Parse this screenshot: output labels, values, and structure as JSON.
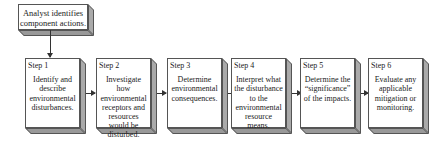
{
  "start": {
    "text": "Analyst identifies component actions."
  },
  "steps": [
    {
      "label": "Step 1",
      "text": "Identify and describe environmental disturbances."
    },
    {
      "label": "Step 2",
      "text": "Investigate how environmental receptors and resources would be disturbed."
    },
    {
      "label": "Step 3",
      "text": "Determine environmental consequences."
    },
    {
      "label": "Step 4",
      "text": "Interpret what the disturbance to the environmental resource means."
    },
    {
      "label": "Step 5",
      "text": "Determine the “significance” of the impacts."
    },
    {
      "label": "Step 6",
      "text": "Evaluate any applicable mitigation or monitoring."
    }
  ]
}
